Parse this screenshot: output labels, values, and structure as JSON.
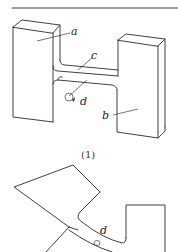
{
  "figure": {
    "top_rule": true,
    "part1": {
      "caption": "(1)",
      "labels": {
        "a": "a",
        "b": "b",
        "c": "c",
        "d": "d"
      }
    },
    "part2": {
      "labels": {
        "d": "d"
      }
    }
  },
  "colors": {
    "stroke": "#2a2a2a",
    "background": "#ffffff"
  }
}
